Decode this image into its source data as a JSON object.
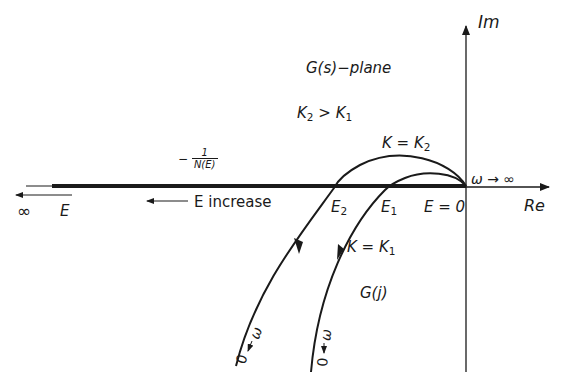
{
  "figure": {
    "plane_label": "G(s)−plane",
    "gain_relation": {
      "k2": "K",
      "k2_sub": "2",
      "op": ">",
      "k1": "K",
      "k1_sub": "1"
    },
    "axes": {
      "imag_label": "Im",
      "real_label": "Re",
      "omega_inf_label": "ω → ∞"
    },
    "describing_function_locus": {
      "prefix": "−",
      "numerator": "1",
      "denominator": "N(E)",
      "direction_label": "E  increase",
      "infinity_label": "∞",
      "e_label": "E"
    },
    "intersections": [
      {
        "name": "E",
        "sub": "2"
      },
      {
        "name": "E",
        "sub": "1"
      },
      {
        "name": "E = 0",
        "sub": ""
      }
    ],
    "curves": [
      {
        "label_prefix": "K = K",
        "label_sub": "2",
        "omega_label": "ω",
        "zero_label": "0"
      },
      {
        "label_prefix": "K = K",
        "label_sub": "1",
        "omega_label": "ω",
        "zero_label": "0"
      }
    ],
    "nyquist_label": "G(j)",
    "colors": {
      "ink": "#1a1a1a",
      "background": "#ffffff"
    }
  }
}
